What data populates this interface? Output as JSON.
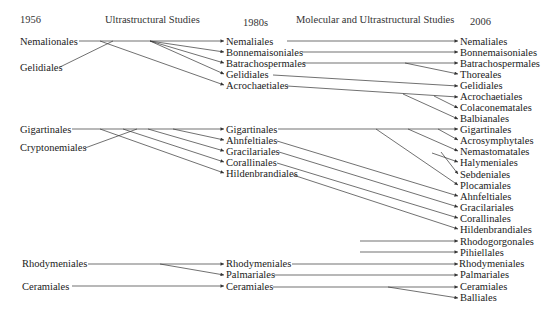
{
  "headers": {
    "col1": "1956",
    "era1": "Ultrastructural Studies",
    "col2": "1980s",
    "era2": "Molecular and Ultrastructural Studies",
    "col3": "2006"
  },
  "colors": {
    "text": "#222222",
    "line": "#333333"
  },
  "col1": [
    {
      "label": "Nemalionales",
      "y": 42
    },
    {
      "label": "Gelidiales",
      "y": 68
    },
    {
      "label": "Gigartinales",
      "y": 130
    },
    {
      "label": "Cryptonemiales",
      "y": 148
    },
    {
      "label": "Rhodymeniales",
      "y": 264
    },
    {
      "label": "Ceramiales",
      "y": 287
    }
  ],
  "col2": [
    {
      "label": "Nemaliales",
      "y": 42
    },
    {
      "label": "Bonnemaisoniales",
      "y": 53
    },
    {
      "label": "Batrachospermales",
      "y": 64
    },
    {
      "label": "Gelidiales",
      "y": 75
    },
    {
      "label": "Acrochaetiales",
      "y": 86
    },
    {
      "label": "Gigartinales",
      "y": 130
    },
    {
      "label": "Ahnfeltiales",
      "y": 141
    },
    {
      "label": "Gracilariales",
      "y": 152
    },
    {
      "label": "Corallinales",
      "y": 163
    },
    {
      "label": "Hildenbrandiales",
      "y": 174
    },
    {
      "label": "Rhodymeniales",
      "y": 264
    },
    {
      "label": "Palmariales",
      "y": 275
    },
    {
      "label": "Ceramiales",
      "y": 287
    }
  ],
  "col3": [
    {
      "label": "Nemaliales",
      "y": 42
    },
    {
      "label": "Bonnemaisoniales",
      "y": 53
    },
    {
      "label": "Batrachospermales",
      "y": 64
    },
    {
      "label": "Thoreales",
      "y": 75
    },
    {
      "label": "Gelidiales",
      "y": 86
    },
    {
      "label": "Acrochaetiales",
      "y": 97
    },
    {
      "label": "Colaconematales",
      "y": 108
    },
    {
      "label": "Balbianales",
      "y": 119
    },
    {
      "label": "Gigartinales",
      "y": 130
    },
    {
      "label": "Acrosymphytales",
      "y": 141
    },
    {
      "label": "Nemastomatales",
      "y": 152
    },
    {
      "label": "Halymeniales",
      "y": 163
    },
    {
      "label": "Sebdeniales",
      "y": 175
    },
    {
      "label": "Plocamiales",
      "y": 186
    },
    {
      "label": "Ahnfeltiales",
      "y": 197
    },
    {
      "label": "Gracilariales",
      "y": 208
    },
    {
      "label": "Corallinales",
      "y": 219
    },
    {
      "label": "Hildenbrandiales",
      "y": 230
    },
    {
      "label": "Rhodogorgonales",
      "y": 242
    },
    {
      "label": "Pihiellales",
      "y": 253
    },
    {
      "label": "Rhodymeniales",
      "y": 264
    },
    {
      "label": "Palmariales",
      "y": 275
    },
    {
      "label": "Ceramiales",
      "y": 287
    },
    {
      "label": "Balliales",
      "y": 298
    }
  ],
  "links_1_to_2": [
    [
      "Nemalionales",
      "Nemaliales"
    ],
    [
      "Nemalionales",
      "Bonnemaisoniales"
    ],
    [
      "Nemalionales",
      "Batrachospermales"
    ],
    [
      "Nemalionales",
      "Gelidiales"
    ],
    [
      "Nemalionales",
      "Acrochaetiales"
    ],
    [
      "Gelidiales",
      "Nemalionales-trunk"
    ],
    [
      "Gigartinales",
      "Gigartinales"
    ],
    [
      "Gigartinales",
      "Ahnfeltiales"
    ],
    [
      "Gigartinales",
      "Gracilariales"
    ],
    [
      "Gigartinales",
      "Corallinales"
    ],
    [
      "Gigartinales",
      "Hildenbrandiales"
    ],
    [
      "Cryptonemiales",
      "Gigartinales-trunk"
    ],
    [
      "Rhodymeniales",
      "Rhodymeniales"
    ],
    [
      "Rhodymeniales",
      "Palmariales"
    ],
    [
      "Ceramiales",
      "Ceramiales"
    ]
  ],
  "links_2_to_3": [
    [
      "Nemaliales",
      "Nemaliales"
    ],
    [
      "Bonnemaisoniales",
      "Bonnemaisoniales"
    ],
    [
      "Batrachospermales",
      "Batrachospermales"
    ],
    [
      "Batrachospermales",
      "Thoreales"
    ],
    [
      "Gelidiales",
      "Gelidiales"
    ],
    [
      "Acrochaetiales",
      "Acrochaetiales"
    ],
    [
      "Acrochaetiales",
      "Colaconematales"
    ],
    [
      "Acrochaetiales",
      "Balbianales"
    ],
    [
      "Gigartinales",
      "Gigartinales"
    ],
    [
      "Gigartinales",
      "Acrosymphytales"
    ],
    [
      "Gigartinales",
      "Nemastomatales"
    ],
    [
      "Gigartinales",
      "Halymeniales"
    ],
    [
      "Gigartinales",
      "Sebdeniales"
    ],
    [
      "Gigartinales",
      "Plocamiales"
    ],
    [
      "Ahnfeltiales",
      "Ahnfeltiales"
    ],
    [
      "Gracilariales",
      "Gracilariales"
    ],
    [
      "Corallinales",
      "Corallinales"
    ],
    [
      "Hildenbrandiales",
      "Hildenbrandiales"
    ],
    [
      "(new)",
      "Rhodogorgonales"
    ],
    [
      "(new)",
      "Pihiellales"
    ],
    [
      "Rhodymeniales",
      "Rhodymeniales"
    ],
    [
      "Palmariales",
      "Palmariales"
    ],
    [
      "Ceramiales",
      "Ceramiales"
    ],
    [
      "Ceramiales",
      "Balliales"
    ]
  ]
}
